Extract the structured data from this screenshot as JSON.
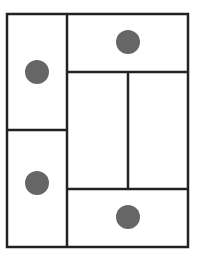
{
  "diagram": {
    "type": "rectangular-partition",
    "colors": {
      "background": "#ffffff",
      "stroke": "#222222",
      "dot": "#666666"
    },
    "stroke_width": 2.5,
    "outer_frame": {
      "x1": 7,
      "y1": 14,
      "x2": 188,
      "y2": 247
    },
    "lines": [
      {
        "id": "left-column-divider",
        "x1": 67,
        "y1": 14,
        "x2": 67,
        "y2": 247
      },
      {
        "id": "left-horizontal-divider",
        "x1": 7,
        "y1": 130,
        "x2": 67,
        "y2": 130
      },
      {
        "id": "right-top-horizontal-divider",
        "x1": 67,
        "y1": 72,
        "x2": 188,
        "y2": 72
      },
      {
        "id": "right-bottom-horizontal-divider",
        "x1": 67,
        "y1": 189,
        "x2": 188,
        "y2": 189
      },
      {
        "id": "right-middle-vertical-divider",
        "x1": 128,
        "y1": 72,
        "x2": 128,
        "y2": 189
      }
    ],
    "regions": [
      {
        "id": "left-top",
        "has_dot": true
      },
      {
        "id": "left-bottom",
        "has_dot": true
      },
      {
        "id": "right-top",
        "has_dot": true
      },
      {
        "id": "right-middle-left",
        "has_dot": false
      },
      {
        "id": "right-middle-right",
        "has_dot": false
      },
      {
        "id": "right-bottom",
        "has_dot": true
      }
    ],
    "dots": [
      {
        "id": "dot-left-top",
        "cx": 37,
        "cy": 72,
        "r": 12
      },
      {
        "id": "dot-right-top",
        "cx": 128,
        "cy": 42,
        "r": 12
      },
      {
        "id": "dot-left-bottom",
        "cx": 37,
        "cy": 183,
        "r": 12
      },
      {
        "id": "dot-right-bottom",
        "cx": 128,
        "cy": 217,
        "r": 12
      }
    ]
  }
}
